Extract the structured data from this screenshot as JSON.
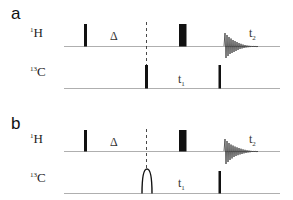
{
  "diagram": {
    "type": "nmr-pulse-sequence",
    "colors": {
      "line": "#9a9a9a",
      "pulse": "#111111",
      "text": "#222222"
    },
    "panels": [
      {
        "label": "a",
        "channels": [
          {
            "nucleus": "H",
            "mass": "1"
          },
          {
            "nucleus": "C",
            "mass": "13"
          }
        ],
        "delays": {
          "delta": "Δ",
          "t1": "t",
          "t1_sub": "1",
          "t2": "t",
          "t2_sub": "2"
        },
        "c_first_pulse": "hard-90"
      },
      {
        "label": "b",
        "channels": [
          {
            "nucleus": "H",
            "mass": "1"
          },
          {
            "nucleus": "C",
            "mass": "13"
          }
        ],
        "delays": {
          "delta": "Δ",
          "t1": "t",
          "t1_sub": "1",
          "t2": "t",
          "t2_sub": "2"
        },
        "c_first_pulse": "shaped-selective"
      }
    ]
  }
}
